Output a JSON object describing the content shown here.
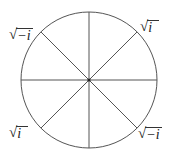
{
  "diagram": {
    "type": "circle-divided-into-eight-sectors",
    "center": [
      89,
      80
    ],
    "radius": 68,
    "stroke_color": "#555555",
    "center_dot_color": "#222222",
    "spokes_deg": [
      0,
      45,
      90,
      135
    ]
  },
  "labels": {
    "top_left": {
      "radical": "√",
      "radicand": "−i"
    },
    "top_right": {
      "radical": "√",
      "radicand": "i"
    },
    "bottom_left": {
      "radical": "√",
      "radicand": "i"
    },
    "bottom_right": {
      "radical": "√",
      "radicand": "−i"
    }
  }
}
